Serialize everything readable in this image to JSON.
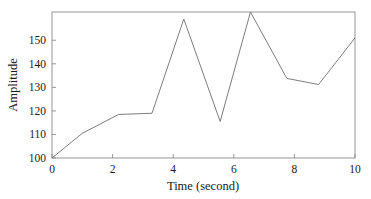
{
  "chart_data": {
    "type": "line",
    "title": "",
    "xlabel": "Time (second)",
    "ylabel": "Amplitude",
    "xlim": [
      0,
      10
    ],
    "ylim": [
      100,
      162
    ],
    "grid": false,
    "legend": null,
    "xticks": [
      0,
      2,
      4,
      6,
      8,
      10
    ],
    "xtick_labels": [
      "0",
      "2",
      "4",
      "6",
      "8",
      "10"
    ],
    "yticks": [
      100,
      110,
      120,
      130,
      140,
      150
    ],
    "ytick_labels": [
      "100",
      "110",
      "120",
      "130",
      "140",
      "150"
    ],
    "series": [
      {
        "name": "amplitude",
        "color": "#7d7d7d",
        "x": [
          0,
          1.0,
          2.2,
          3.3,
          4.35,
          5.55,
          6.55,
          7.75,
          8.8,
          10
        ],
        "y": [
          100,
          110.5,
          118.5,
          119.0,
          159.0,
          115.5,
          162.0,
          133.8,
          131.2,
          151.0
        ]
      }
    ]
  },
  "axes": {
    "x_title": "Time (second)",
    "y_title": "Amplitude"
  },
  "frame": {
    "left": 52,
    "right": 355,
    "top": 12,
    "bottom": 158
  }
}
